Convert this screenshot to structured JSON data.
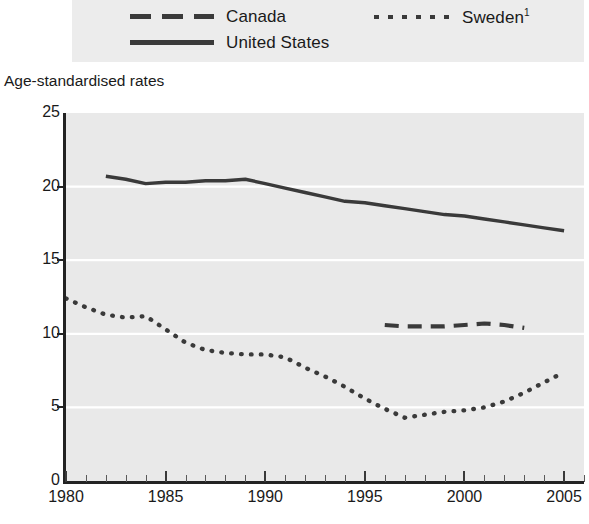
{
  "legend": {
    "entries": [
      {
        "label": "Canada",
        "style": "dashed",
        "color": "#3a3a3a"
      },
      {
        "label": "United States",
        "style": "solid",
        "color": "#3a3a3a"
      },
      {
        "label": "Sweden",
        "superscript": "1",
        "style": "dotted",
        "color": "#3a3a3a"
      }
    ]
  },
  "axis_title": "Age-standardised rates",
  "chart_data": {
    "type": "line",
    "title": "",
    "subtitle": "",
    "xlabel": "",
    "ylabel": "Age-standardised rates",
    "xlim": [
      1980,
      2006
    ],
    "ylim": [
      0,
      25
    ],
    "grid": "horizontal",
    "legend_position": "top",
    "background_color": "#e9e9e9",
    "xticks": [
      1980,
      1985,
      1990,
      1995,
      2000,
      2005
    ],
    "xtick_labels": [
      "1980",
      "1985",
      "1990",
      "1995",
      "2000",
      "2005"
    ],
    "yticks": [
      0,
      5,
      10,
      15,
      20,
      25
    ],
    "ytick_labels": [
      "0",
      "5",
      "10",
      "15",
      "20",
      "25"
    ],
    "minor_xtick_interval": 1,
    "series": [
      {
        "name": "Canada",
        "style": "dashed",
        "color": "#3a3a3a",
        "x": [
          1996,
          1997,
          1998,
          1999,
          2000,
          2001,
          2002,
          2003
        ],
        "values": [
          10.6,
          10.5,
          10.5,
          10.5,
          10.6,
          10.7,
          10.6,
          10.4
        ]
      },
      {
        "name": "United States",
        "style": "solid",
        "color": "#3a3a3a",
        "x": [
          1982,
          1983,
          1984,
          1985,
          1986,
          1987,
          1988,
          1989,
          1990,
          1991,
          1992,
          1993,
          1994,
          1995,
          1996,
          1997,
          1998,
          1999,
          2000,
          2001,
          2002,
          2003,
          2004,
          2005
        ],
        "values": [
          20.7,
          20.5,
          20.2,
          20.3,
          20.3,
          20.4,
          20.4,
          20.5,
          20.2,
          19.9,
          19.6,
          19.3,
          19.0,
          18.9,
          18.7,
          18.5,
          18.3,
          18.1,
          18.0,
          17.8,
          17.6,
          17.4,
          17.2,
          17.0
        ]
      },
      {
        "name": "Sweden",
        "style": "dotted",
        "color": "#3a3a3a",
        "x": [
          1980,
          1981,
          1982,
          1983,
          1984,
          1985,
          1986,
          1987,
          1988,
          1989,
          1990,
          1991,
          1992,
          1993,
          1994,
          1995,
          1996,
          1997,
          1998,
          1999,
          2000,
          2001,
          2002,
          2003,
          2004,
          2005
        ],
        "values": [
          12.4,
          11.8,
          11.3,
          11.1,
          11.2,
          10.3,
          9.4,
          8.9,
          8.7,
          8.6,
          8.6,
          8.4,
          7.7,
          7.1,
          6.4,
          5.6,
          4.9,
          4.3,
          4.5,
          4.7,
          4.8,
          5.0,
          5.4,
          6.0,
          6.7,
          7.4
        ]
      }
    ]
  }
}
